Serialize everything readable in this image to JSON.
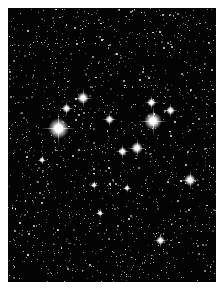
{
  "image": {
    "subject": "open star cluster in dense star field",
    "background_color": "#030303",
    "border_color": "#ffffff",
    "bright_stars": [
      {
        "x": 58,
        "y": 128,
        "r": 7
      },
      {
        "x": 153,
        "y": 121,
        "r": 6
      },
      {
        "x": 83,
        "y": 98,
        "r": 4
      },
      {
        "x": 151,
        "y": 102,
        "r": 3
      },
      {
        "x": 137,
        "y": 148,
        "r": 4
      },
      {
        "x": 122,
        "y": 151,
        "r": 3
      },
      {
        "x": 190,
        "y": 180,
        "r": 4
      },
      {
        "x": 160,
        "y": 240,
        "r": 3
      },
      {
        "x": 109,
        "y": 119,
        "r": 3
      },
      {
        "x": 170,
        "y": 110,
        "r": 3
      },
      {
        "x": 66,
        "y": 108,
        "r": 3
      },
      {
        "x": 42,
        "y": 160,
        "r": 2
      },
      {
        "x": 94,
        "y": 185,
        "r": 2
      },
      {
        "x": 127,
        "y": 188,
        "r": 2
      },
      {
        "x": 100,
        "y": 213,
        "r": 2
      }
    ]
  }
}
